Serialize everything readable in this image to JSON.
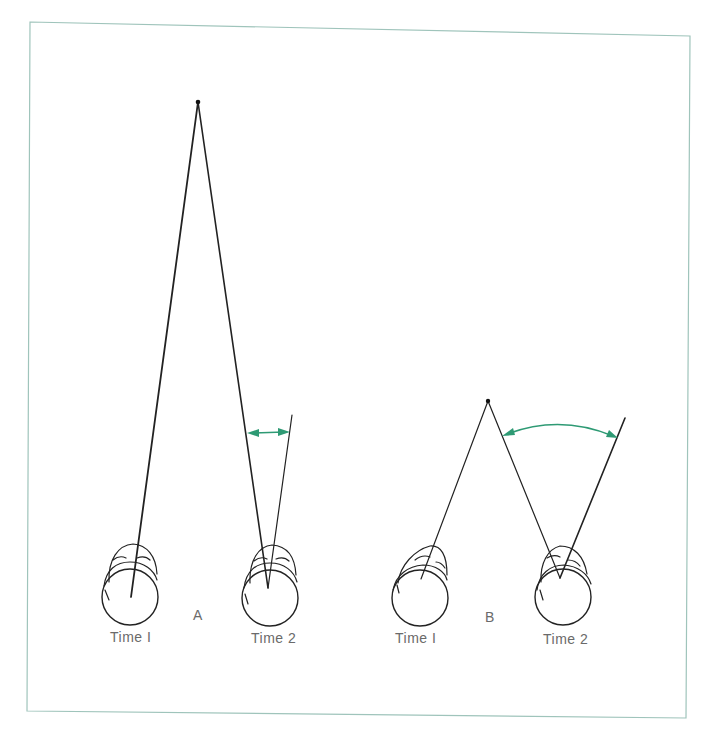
{
  "figure": {
    "frame_color": "#9fc4bb",
    "accent_color": "#2e9a74",
    "line_color": "#222222",
    "label_color": "#6a6a6a"
  },
  "panels": [
    {
      "id": "A",
      "letter": "A",
      "description": "Distant fixation point: small change in angle of convergence between Time 1 and Time 2",
      "fixation_point": {
        "x": 198,
        "y": 102
      },
      "heads": [
        {
          "label": "Time I",
          "center": {
            "x": 130,
            "y": 597
          }
        },
        {
          "label": "Time 2",
          "center": {
            "x": 270,
            "y": 597
          }
        }
      ],
      "angle_arrow": {
        "type": "straight",
        "from": {
          "x": 247,
          "y": 433
        },
        "to": {
          "x": 289,
          "y": 432
        }
      }
    },
    {
      "id": "B",
      "letter": "B",
      "description": "Near fixation point: large change in angle of convergence between Time 1 and Time 2",
      "fixation_point": {
        "x": 488,
        "y": 401
      },
      "heads": [
        {
          "label": "Time I",
          "center": {
            "x": 420,
            "y": 598
          }
        },
        {
          "label": "Time 2",
          "center": {
            "x": 563,
            "y": 597
          }
        }
      ],
      "angle_arrow": {
        "type": "arc",
        "from": {
          "x": 503,
          "y": 435
        },
        "to": {
          "x": 617,
          "y": 437
        }
      }
    }
  ],
  "labels": {
    "panel_a_letter": "A",
    "panel_a_time1": "Time I",
    "panel_a_time2": "Time 2",
    "panel_b_letter": "B",
    "panel_b_time1": "Time I",
    "panel_b_time2": "Time 2"
  }
}
